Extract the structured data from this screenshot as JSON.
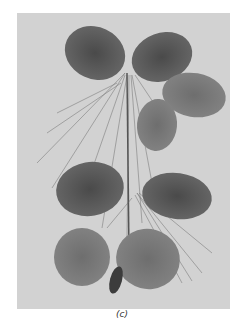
{
  "figure": {
    "caption": "(c)",
    "background_color": "#d2d2d2",
    "leaf_color": "#5a5a5a"
  }
}
